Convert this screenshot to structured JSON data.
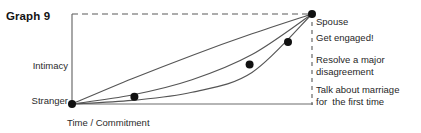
{
  "figure": {
    "title": "Graph 9"
  },
  "chart_data": {
    "type": "line",
    "title": "Graph 9",
    "xlabel": "Time / Commitment",
    "ylabel": "",
    "grid": false,
    "legend": "none",
    "y_tick_labels": [
      "Stranger",
      "Intimacy"
    ],
    "x_tick_labels": [],
    "xlim": [
      0,
      1
    ],
    "ylim": [
      0,
      1
    ],
    "axis_origin_label": "Stranger",
    "axis_top_label": "Intimacy",
    "annotations": [
      {
        "id": "spouse",
        "text": "Spouse"
      },
      {
        "id": "engaged",
        "text": "Get engaged!"
      },
      {
        "id": "resolve",
        "text": "Resolve a major\ndisagreement"
      },
      {
        "id": "marriage",
        "text": "Talk about marriage\nfor  the first time"
      }
    ],
    "series": [
      {
        "name": "upper-curve",
        "x": [
          0.0,
          0.25,
          0.5,
          0.75,
          1.0
        ],
        "y": [
          0.0,
          0.28,
          0.54,
          0.78,
          1.0
        ]
      },
      {
        "name": "middle-curve",
        "x": [
          0.0,
          0.25,
          0.5,
          0.75,
          1.0
        ],
        "y": [
          0.0,
          0.1,
          0.27,
          0.55,
          1.0
        ]
      },
      {
        "name": "lower-curve",
        "x": [
          0.0,
          0.25,
          0.5,
          0.75,
          1.0
        ],
        "y": [
          0.0,
          0.04,
          0.13,
          0.35,
          1.0
        ]
      }
    ],
    "points": [
      {
        "label": "Talk about marriage for  the first time",
        "x": 0.26,
        "y": 0.08
      },
      {
        "label": "Resolve a major disagreement",
        "x": 0.74,
        "y": 0.44
      },
      {
        "label": "Get engaged!",
        "x": 0.9,
        "y": 0.69
      },
      {
        "label": "Spouse",
        "x": 1.0,
        "y": 1.0
      },
      {
        "label": "Stranger",
        "x": 0.0,
        "y": 0.0
      }
    ],
    "colors": {
      "curve": "#555555",
      "point": "#111111",
      "axis": "#6d6d6d",
      "dashed": "#5a5a5a"
    }
  }
}
